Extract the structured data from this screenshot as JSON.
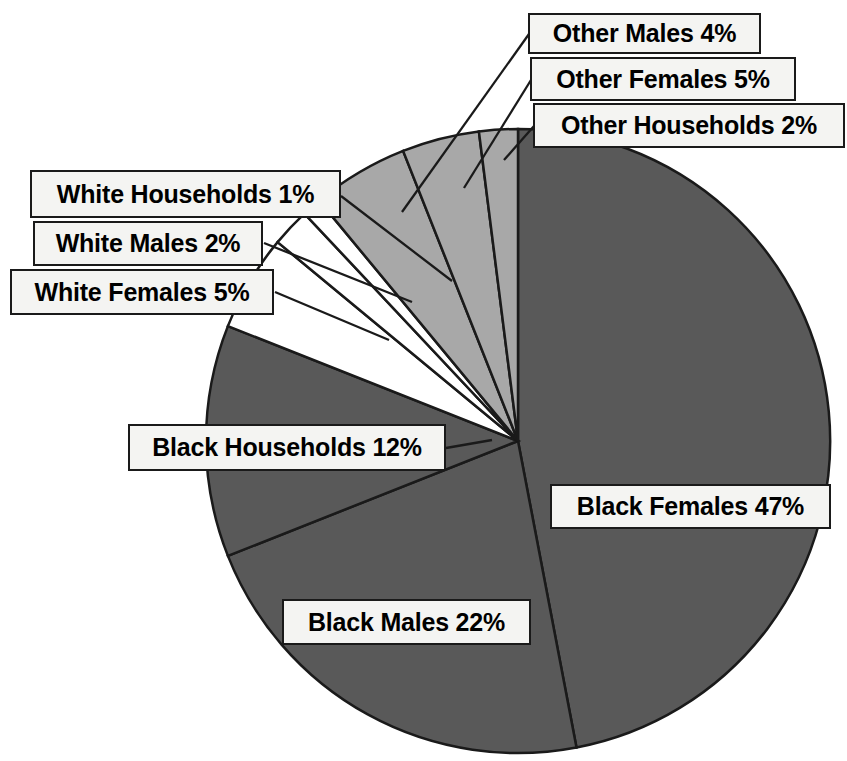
{
  "chart_data": {
    "type": "pie",
    "title": "",
    "subtitle": "",
    "xlabel": "",
    "ylabel": "",
    "legend_position": "none",
    "grid": false,
    "labels_show_percent": true,
    "start_angle_deg": 0,
    "direction": "clockwise",
    "categories": [
      "Black Females",
      "Black Males",
      "Black Households",
      "White Females",
      "White Males",
      "White Households",
      "Other Females",
      "Other Males",
      "Other Households"
    ],
    "values": [
      47,
      22,
      12,
      5,
      2,
      1,
      5,
      4,
      2
    ],
    "units": "percent",
    "total": 100,
    "slices": [
      {
        "name": "Black Females",
        "label": "Black Females 47%",
        "value": 47,
        "color": "#595959",
        "group": "Black"
      },
      {
        "name": "Black Males",
        "label": "Black Males 22%",
        "value": 22,
        "color": "#595959",
        "group": "Black"
      },
      {
        "name": "Black Households",
        "label": "Black Households 12%",
        "value": 12,
        "color": "#595959",
        "group": "Black"
      },
      {
        "name": "White Females",
        "label": "White Females 5%",
        "value": 5,
        "color": "#ffffff",
        "group": "White"
      },
      {
        "name": "White Males",
        "label": "White Males 2%",
        "value": 2,
        "color": "#ffffff",
        "group": "White"
      },
      {
        "name": "White Households",
        "label": "White Households 1%",
        "value": 1,
        "color": "#ffffff",
        "group": "White"
      },
      {
        "name": "Other Females",
        "label": "Other Females 5%",
        "value": 5,
        "color": "#a8a8a8",
        "group": "Other"
      },
      {
        "name": "Other Males",
        "label": "Other Males 4%",
        "value": 4,
        "color": "#a8a8a8",
        "group": "Other"
      },
      {
        "name": "Other Households",
        "label": "Other Households 2%",
        "value": 2,
        "color": "#a8a8a8",
        "group": "Other"
      }
    ],
    "colors": {
      "black_group": "#595959",
      "white_group": "#ffffff",
      "other_group": "#a8a8a8",
      "outline": "#1a1a1a",
      "label_background": "#f4f4f2",
      "label_border": "#1a1a1a",
      "label_text": "#000000",
      "page_background": "#ffffff"
    }
  }
}
